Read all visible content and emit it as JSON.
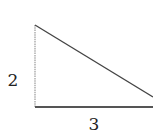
{
  "diagram": {
    "type": "right-triangle",
    "labels": {
      "vertical_leg": "2",
      "horizontal_leg": "3"
    },
    "vertices": {
      "top": [
        35,
        25
      ],
      "right_angle": [
        35,
        107
      ],
      "right": [
        153,
        97
      ]
    },
    "colors": {
      "background": "#ffffff",
      "stroke_vertical": "#9a9a9a",
      "stroke_horizontal": "#555555",
      "stroke_hypotenuse": "#444444",
      "label": "#222222"
    }
  }
}
